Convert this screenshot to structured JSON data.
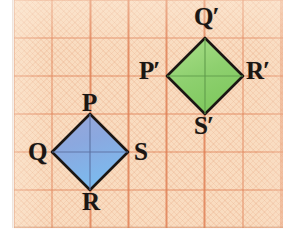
{
  "figure": {
    "background_color": "#f9dcc0",
    "grid_line_color": "#e08156",
    "grid_cell_px": 38,
    "outline_color": "#1b1613"
  },
  "chart_data": {
    "type": "scatter",
    "xlabel": "",
    "ylabel": "",
    "grid": true,
    "legend": "none",
    "grid_cell_units": 1,
    "shapes": [
      {
        "name": "PQRS",
        "role": "pre-image",
        "fill_color": "#7fa8de",
        "fill_gradient": [
          "#8f9fd6",
          "#7fb4e8"
        ],
        "stroke_color": "#1b1613",
        "vertices": [
          {
            "label": "P",
            "x": 90,
            "y": 114,
            "grid_x": 2,
            "grid_y": 3
          },
          {
            "label": "S",
            "x": 128,
            "y": 152,
            "grid_x": 3,
            "grid_y": 4
          },
          {
            "label": "R",
            "x": 90,
            "y": 190,
            "grid_x": 2,
            "grid_y": 5
          },
          {
            "label": "Q",
            "x": 52,
            "y": 152,
            "grid_x": 1,
            "grid_y": 4
          }
        ]
      },
      {
        "name": "P'Q'R'S'",
        "role": "image",
        "fill_color": "#8ed173",
        "fill_gradient": [
          "#a6dd85",
          "#7ec95f"
        ],
        "stroke_color": "#1b1613",
        "vertices": [
          {
            "label": "Q'",
            "x": 205,
            "y": 38,
            "grid_x": 5,
            "grid_y": 1
          },
          {
            "label": "R'",
            "x": 243,
            "y": 76,
            "grid_x": 6,
            "grid_y": 2
          },
          {
            "label": "S'",
            "x": 205,
            "y": 114,
            "grid_x": 5,
            "grid_y": 3
          },
          {
            "label": "P'",
            "x": 167,
            "y": 76,
            "grid_x": 4,
            "grid_y": 2
          }
        ]
      }
    ],
    "transformation": {
      "type": "translation",
      "dx_cells": 3,
      "dy_cells": -2,
      "mapping": [
        {
          "from": "P",
          "to": "Q'"
        },
        {
          "from": "Q",
          "to": "P'"
        },
        {
          "from": "R",
          "to": "S'"
        },
        {
          "from": "S",
          "to": "R'"
        }
      ]
    }
  },
  "labels": {
    "pre_image": {
      "P": "P",
      "Q": "Q",
      "R": "R",
      "S": "S"
    },
    "image": {
      "P_prime_letter": "P",
      "Q_prime_letter": "Q",
      "R_prime_letter": "R",
      "S_prime_letter": "S",
      "prime_mark": "′"
    }
  }
}
